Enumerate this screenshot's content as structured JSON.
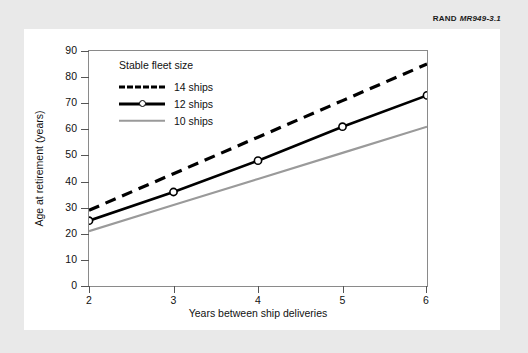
{
  "source_credit": {
    "org": "RAND",
    "id": "MR949-3.1"
  },
  "chart_data": {
    "type": "line",
    "title": "",
    "xlabel": "Years between ship deliveries",
    "ylabel": "Age at retirement (years)",
    "x": [
      2,
      3,
      4,
      5,
      6
    ],
    "xlim": [
      2,
      6
    ],
    "ylim": [
      0,
      90
    ],
    "xticks": [
      "2",
      "3",
      "4",
      "5",
      "6"
    ],
    "yticks": [
      "0",
      "10",
      "20",
      "30",
      "40",
      "50",
      "60",
      "70",
      "80",
      "90"
    ],
    "grid": false,
    "legend_position": "top-left-inside",
    "legend_title": "Stable fleet size",
    "series": [
      {
        "name": "14 ships",
        "values": [
          29,
          43,
          57,
          71,
          85
        ],
        "style": "dashed",
        "color": "#000000",
        "marker": "none"
      },
      {
        "name": "12 ships",
        "values": [
          25,
          36,
          48,
          61,
          73
        ],
        "style": "solid",
        "color": "#000000",
        "marker": "circle"
      },
      {
        "name": "10 ships",
        "values": [
          21,
          31,
          41,
          51,
          61
        ],
        "style": "solid",
        "color": "#9a9a9a",
        "marker": "none"
      }
    ]
  }
}
